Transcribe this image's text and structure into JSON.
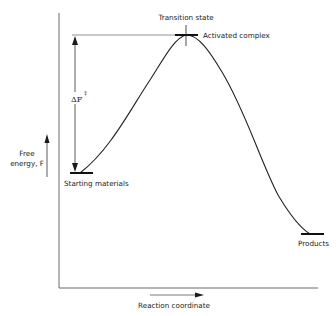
{
  "diagram": {
    "type": "reaction-energy-profile",
    "colors": {
      "ink": "#1a1a1a",
      "reference_line": "#777777",
      "background": "#ffffff"
    },
    "axes": {
      "y_label_line1": "Free",
      "y_label_line2": "energy, F",
      "x_label": "Reaction coordinate"
    },
    "labels": {
      "transition_state": "Transition state",
      "activated_complex": "Activated complex",
      "starting_materials": "Starting materials",
      "products": "Products",
      "activation_energy": "ΔF",
      "activation_energy_superscript": "‡"
    },
    "levels": {
      "starting_materials_y": 173,
      "transition_state_y": 35,
      "products_y": 234
    }
  }
}
